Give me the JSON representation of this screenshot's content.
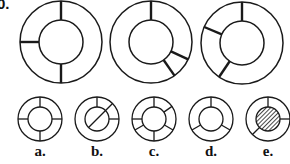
{
  "question": {
    "number_label": "0."
  },
  "stroke_color": "#1a1a1a",
  "sequence": [
    {
      "cx": 61,
      "cy": 42,
      "r_outer": 41,
      "r_inner": 22,
      "spokes_deg": [
        90,
        180,
        270
      ]
    },
    {
      "cx": 151,
      "cy": 42,
      "r_outer": 41,
      "r_inner": 22,
      "spokes_deg": [
        90,
        -25,
        -55
      ]
    },
    {
      "cx": 242,
      "cy": 43,
      "r_outer": 41,
      "r_inner": 22,
      "spokes_deg": [
        90,
        157,
        236
      ]
    }
  ],
  "options": [
    {
      "label": "a.",
      "cx": 40,
      "cy": 119,
      "r_outer": 22,
      "r_inner": 12,
      "spokes_deg": [
        90,
        0,
        180,
        270
      ],
      "diagonal": false,
      "hatched": false
    },
    {
      "label": "b.",
      "cx": 97,
      "cy": 119,
      "r_outer": 22,
      "r_inner": 12,
      "spokes_deg": [
        90,
        0
      ],
      "diagonal": true,
      "hatched": false
    },
    {
      "label": "c.",
      "cx": 154,
      "cy": 119,
      "r_outer": 22,
      "r_inner": 12,
      "spokes_deg": [
        90,
        35,
        -30,
        270,
        210,
        180
      ],
      "diagonal": false,
      "hatched": false
    },
    {
      "label": "d.",
      "cx": 211,
      "cy": 119,
      "r_outer": 22,
      "r_inner": 12,
      "spokes_deg": [
        90,
        -30,
        210
      ],
      "diagonal": false,
      "hatched": false
    },
    {
      "label": "e.",
      "cx": 268,
      "cy": 119,
      "r_outer": 22,
      "r_inner": 12,
      "spokes_deg": [
        90,
        0,
        225
      ],
      "diagonal": false,
      "hatched": true
    }
  ]
}
